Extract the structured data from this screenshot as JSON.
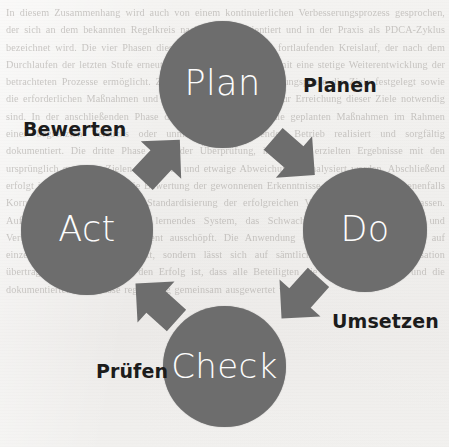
{
  "diagram": {
    "kind": "pdca-cycle",
    "colors": {
      "circle_fill": "#6d6d6d",
      "arrow_fill": "#6d6d6d",
      "circle_text": "#fdfdfd",
      "label_text": "#1c1c1c",
      "page_background": "#f2f1ef"
    },
    "nodes": [
      {
        "id": "plan",
        "label": "Plan",
        "german": "Planen",
        "cx": 222,
        "cy": 85,
        "r": 63
      },
      {
        "id": "do",
        "label": "Do",
        "german": "Umsetzen",
        "cx": 365,
        "cy": 230,
        "r": 62
      },
      {
        "id": "check",
        "label": "Check",
        "german": "Prüfen",
        "cx": 225,
        "cy": 367,
        "r": 61
      },
      {
        "id": "act",
        "label": "Act",
        "german": "Bewerten",
        "cx": 87,
        "cy": 230,
        "r": 65
      }
    ],
    "arrows": [
      {
        "id": "plan-do",
        "from": "Plan",
        "to": "Do",
        "icon": "chevron-arrow-icon",
        "direction": "down-right"
      },
      {
        "id": "do-check",
        "from": "Do",
        "to": "Check",
        "icon": "chevron-arrow-icon",
        "direction": "down-left"
      },
      {
        "id": "check-act",
        "from": "Check",
        "to": "Act",
        "icon": "chevron-arrow-icon",
        "direction": "up-left"
      },
      {
        "id": "act-plan",
        "from": "Act",
        "to": "Plan",
        "icon": "chevron-arrow-icon",
        "direction": "up-right"
      }
    ],
    "german_labels": {
      "planen": "Planen",
      "umsetzen": "Umsetzen",
      "pruefen": "Prüfen",
      "bewerten": "Bewerten"
    }
  },
  "background": {
    "type": "scanned-page-bleedthrough",
    "ghost_text": "In diesem Zusammenhang wird auch von einem kontinuierlichen Verbesserungsprozess gesprochen, der sich an dem bekannten Regelkreis nach Deming orientiert und in der Praxis als PDCA-Zyklus bezeichnet wird. Die vier Phasen dieses Zyklus bilden einen fortlaufenden Kreislauf, der nach dem Durchlaufen der letzten Stufe erneut von vorne beginnt und damit eine stetige Weiterentwicklung der betrachteten Prozesse ermöglicht. Zunächst werden in der Planungsphase die Ziele festgelegt sowie die erforderlichen Maßnahmen und Ressourcen bestimmt, die zur Erreichung dieser Ziele notwendig sind. In der anschließenden Phase der Umsetzung werden die geplanten Maßnahmen im Rahmen eines begrenzten Versuchs oder unmittelbar im laufenden Betrieb realisiert und sorgfältig dokumentiert. Die dritte Phase dient der Überprüfung, indem die erzielten Ergebnisse mit den ursprünglich gesetzten Zielen verglichen und etwaige Abweichungen analysiert werden. Abschließend erfolgt in der vierten Phase die Bewertung der gewonnenen Erkenntnisse, aus der sich gegebenenfalls Korrekturmaßnahmen oder die Standardisierung der erfolgreichen Vorgehensweise ableiten lassen. Auf diese Weise entsteht ein lernendes System, das Schwachstellen frühzeitig erkennt und Verbesserungspotenziale konsequent ausschöpft. Die Anwendung des Zyklus ist dabei nicht auf einzelne Abteilungen beschränkt, sondern lässt sich auf sämtliche Ebenen einer Organisation übertragen. Entscheidend für den Erfolg ist, dass alle Beteiligten die Methode verstehen und die dokumentierten Ergebnisse regelmäßig gemeinsam ausgewertet werden."
  }
}
